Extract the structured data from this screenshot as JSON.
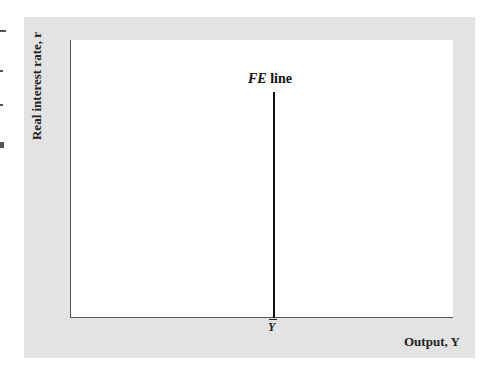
{
  "diagram": {
    "type": "economics-graph",
    "axes": {
      "y_label": "Real interest rate, r",
      "x_label": "Output, Y"
    },
    "curves": [
      {
        "name": "FE line",
        "label_italic": "FE",
        "label_rest": " line",
        "orientation": "vertical",
        "x_position_label": "Y"
      }
    ],
    "x_tick_label": "Y",
    "x_tick_has_bar": true
  },
  "colors": {
    "panel_bg": "#e3e3e3",
    "plot_bg": "#ffffff",
    "line": "#111111",
    "axis": "#555555"
  }
}
